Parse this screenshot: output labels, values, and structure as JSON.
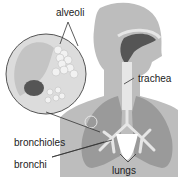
{
  "diagram": {
    "labels": {
      "alveoli": "alveoli",
      "trachea": "trachea",
      "bronchioles": "bronchioles",
      "bronchi": "bronchi",
      "lungs": "lungs"
    },
    "colors": {
      "body": "#b8b8b8",
      "lungs": "#9a9a9a",
      "airway": "#e6e6e6",
      "cavity": "#555555",
      "inset_bg": "#dcdcdc",
      "line": "#333333"
    }
  }
}
